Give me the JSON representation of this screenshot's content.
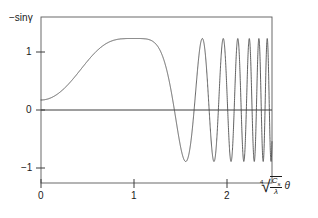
{
  "figure": {
    "name": "contrast-transfer-function-plot",
    "background_color": "#ffffff",
    "line_color": "#444444",
    "axis_color": "#555555"
  },
  "axes": {
    "y_label_prefix": "−sin",
    "y_label_symbol": "γ",
    "x_label_radix_index": "4",
    "x_label_numerator": "C",
    "x_label_numerator_sub": "s",
    "x_label_denominator": "λ",
    "x_label_variable": "θ",
    "x_ticks": [
      "0",
      "1",
      "2"
    ],
    "y_ticks": [
      "1",
      "0",
      "−1"
    ]
  },
  "chart_data": {
    "type": "line",
    "title": "",
    "xlabel": "⁴√(C_s/λ) · θ",
    "ylabel": "−sin γ",
    "xlim": [
      0,
      2.48
    ],
    "ylim": [
      -1.35,
      1.35
    ],
    "xticks": [
      0,
      1,
      2
    ],
    "xticklabels": [
      "0",
      "1",
      "2"
    ],
    "yticks": [
      1,
      0,
      -1
    ],
    "yticklabels": [
      "1",
      "0",
      "−1"
    ],
    "grid": false,
    "legend": false,
    "legend_position": "none",
    "formula": "y = -sin( (pi/2) * (u^4 - 2*u^2) )",
    "series": [
      {
        "name": "-sin gamma",
        "color": "#444444",
        "x": [
          0.0,
          0.05,
          0.1,
          0.15,
          0.2,
          0.25,
          0.3,
          0.35,
          0.4,
          0.45,
          0.5,
          0.55,
          0.6,
          0.65,
          0.7,
          0.75,
          0.8,
          0.85,
          0.9,
          0.95,
          1.0,
          1.05,
          1.1,
          1.15,
          1.2,
          1.25,
          1.3,
          1.35,
          1.4,
          1.45,
          1.5,
          1.55,
          1.6,
          1.65,
          1.7,
          1.75,
          1.8,
          1.85,
          1.9,
          1.95,
          2.0,
          2.05,
          2.1,
          2.15,
          2.2,
          2.25,
          2.3,
          2.35,
          2.4,
          2.45,
          2.48
        ],
        "y": [
          0.0,
          0.006,
          0.031,
          0.07,
          0.124,
          0.192,
          0.273,
          0.365,
          0.464,
          0.566,
          0.666,
          0.759,
          0.84,
          0.905,
          0.952,
          0.981,
          0.996,
          0.999,
          0.994,
          0.983,
          0.968,
          0.947,
          0.915,
          0.86,
          0.77,
          0.641,
          0.488,
          0.367,
          0.401,
          0.67,
          0.971,
          0.641,
          -0.309,
          -0.969,
          -0.524,
          0.604,
          0.995,
          -0.08,
          -0.961,
          0.318,
          0.842,
          -0.742,
          -0.385,
          0.975,
          -0.501,
          -0.609,
          0.999,
          -0.464,
          -0.54,
          0.985,
          -0.3
        ]
      }
    ],
    "features": {
      "first_maximum": {
        "x": 0.84,
        "y": 1.0
      },
      "local_minimum": {
        "x": 1.32,
        "y": 0.36
      },
      "second_maximum": {
        "x": 1.5,
        "y": 1.0
      },
      "first_zero_crossing_after_passband": {
        "x": 1.58,
        "y": 0.0
      },
      "first_minimum": {
        "x": 1.66,
        "y": -1.0
      },
      "description": "Broad positive passband followed by increasingly rapid oscillations between +1 and -1"
    }
  }
}
